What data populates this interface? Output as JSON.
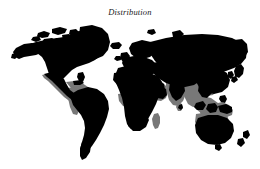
{
  "figure": {
    "title": "Distribution",
    "background_color": "#ffffff",
    "width": 260,
    "height": 169
  },
  "map": {
    "projection": "equirectangular",
    "title": "Distribution",
    "layers": [
      {
        "name": "primary-range",
        "label": "Primary range",
        "color": "#000000",
        "description": "Landmasses shaded solid black"
      },
      {
        "name": "secondary-range",
        "label": "Secondary range",
        "color": "#787878",
        "description": "Tropical and subtropical band shaded medium gray"
      }
    ],
    "regions": [
      {
        "name": "north-america",
        "shading": "primary"
      },
      {
        "name": "greenland",
        "shading": "primary"
      },
      {
        "name": "canadian-arctic-archipelago",
        "shading": "primary"
      },
      {
        "name": "central-america",
        "shading": "secondary"
      },
      {
        "name": "caribbean",
        "shading": "secondary"
      },
      {
        "name": "south-america",
        "shading": "primary"
      },
      {
        "name": "amazon-basin",
        "shading": "secondary"
      },
      {
        "name": "europe",
        "shading": "primary"
      },
      {
        "name": "north-africa",
        "shading": "primary"
      },
      {
        "name": "sub-saharan-africa",
        "shading": "primary"
      },
      {
        "name": "madagascar",
        "shading": "secondary"
      },
      {
        "name": "arabian-peninsula",
        "shading": "secondary"
      },
      {
        "name": "northern-asia",
        "shading": "primary"
      },
      {
        "name": "india",
        "shading": "secondary"
      },
      {
        "name": "southeast-asia",
        "shading": "secondary"
      },
      {
        "name": "indonesia",
        "shading": "secondary"
      },
      {
        "name": "new-guinea",
        "shading": "secondary"
      },
      {
        "name": "australia",
        "shading": "primary"
      },
      {
        "name": "new-zealand",
        "shading": "primary"
      },
      {
        "name": "japan",
        "shading": "primary"
      },
      {
        "name": "british-isles",
        "shading": "primary"
      },
      {
        "name": "iceland",
        "shading": "primary"
      }
    ]
  },
  "colors": {
    "land_primary": "#000000",
    "land_secondary": "#787878",
    "ocean": "#ffffff",
    "title_text": "#1b1b1b"
  }
}
